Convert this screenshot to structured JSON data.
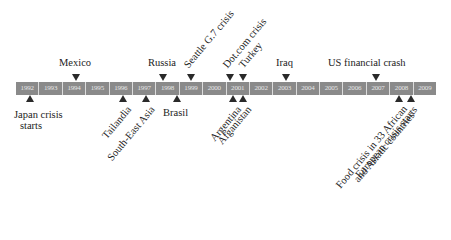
{
  "timeline": {
    "years": [
      "1992",
      "1993",
      "1994",
      "1995",
      "1996",
      "1997",
      "1998",
      "1999",
      "2000",
      "2001",
      "2002",
      "2003",
      "2004",
      "2005",
      "2006",
      "2007",
      "2008",
      "2009"
    ],
    "bar_color": "#8a8a8a",
    "marker_color": "#2a2a2a"
  },
  "events_above": [
    {
      "label": "Mexico",
      "year": "1994"
    },
    {
      "label": "Russia",
      "year": "1998"
    },
    {
      "label": "Seattle G.7 crisis",
      "year": "1999"
    },
    {
      "label": "Dot.com crisis",
      "year": "2001"
    },
    {
      "label": "Turkey",
      "year": "2001"
    },
    {
      "label": "Iraq",
      "year": "2003"
    },
    {
      "label": "US financial crash",
      "year": "2007"
    }
  ],
  "events_below": [
    {
      "label_line1": "Japan crisis",
      "label_line2": "starts",
      "year": "1992"
    },
    {
      "label": "Tailandia",
      "year": "1996"
    },
    {
      "label": "South-East Asia",
      "year": "1997"
    },
    {
      "label": "Brasil",
      "year": "1998"
    },
    {
      "label": "Argentina",
      "year": "2001"
    },
    {
      "label": "Afganistan",
      "year": "2001"
    },
    {
      "label_line1": "Food crisis in 33 African",
      "label_line2": "and Asiatic countries",
      "year": "2008"
    },
    {
      "label": "European crisis starts",
      "year": "2008"
    }
  ]
}
